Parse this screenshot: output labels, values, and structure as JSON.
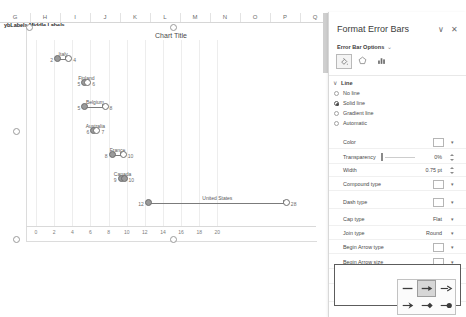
{
  "spreadsheet": {
    "column_headers": [
      "G",
      "H",
      "I",
      "J",
      "K",
      "L",
      "M",
      "N",
      "O",
      "P",
      "Q"
    ],
    "name_box_text": "ybLabels Middle Labels",
    "middle_labels_text": "Middle Labels"
  },
  "chart": {
    "title": "Chart Title",
    "series_label_left": "Left value",
    "series_label_right": "Right value"
  },
  "chart_data": {
    "type": "bar",
    "title": "Chart Title",
    "xlabel": "",
    "ylabel": "",
    "xlim": [
      0,
      30
    ],
    "grid": true,
    "legend": false,
    "orientation": "horizontal",
    "note": "Horizontal dumbbell / range bars with arrow end caps; each category spans from start to end value.",
    "categories": [
      "Italy",
      "Finland",
      "Belgium",
      "Australia",
      "France",
      "Canada",
      "United States"
    ],
    "start_values": [
      2,
      5,
      5,
      6,
      8,
      9,
      12
    ],
    "end_values": [
      4,
      6,
      8,
      7,
      10,
      10,
      28
    ],
    "xticks": [
      0,
      2,
      4,
      6,
      8,
      10,
      12,
      14,
      16,
      18,
      20
    ],
    "xtick_labels": [
      "0",
      "2",
      "4",
      "6",
      "8",
      "10",
      "12",
      "14",
      "16",
      "18",
      "20"
    ]
  },
  "pane": {
    "title": "Format Error Bars",
    "collapse_icon": "∨",
    "close_icon": "✕",
    "options_label": "Error Bar Options",
    "options_chevron": "⌄",
    "tabs": [
      {
        "name": "fill-line-tab",
        "icon": "paint-bucket-icon",
        "selected": true
      },
      {
        "name": "effects-tab",
        "icon": "pentagon-icon",
        "selected": false
      },
      {
        "name": "size-properties-tab",
        "icon": "bar-chart-icon",
        "selected": false
      }
    ],
    "section": {
      "label": "Line",
      "chevron": "∨",
      "radios": [
        {
          "label": "No line",
          "selected": false
        },
        {
          "label": "Solid line",
          "selected": true
        },
        {
          "label": "Gradient line",
          "selected": false
        },
        {
          "label": "Automatic",
          "selected": false
        }
      ],
      "properties": [
        {
          "label": "Color",
          "value": "",
          "control": "color"
        },
        {
          "label": "Transparency",
          "value": "0%",
          "control": "slider-spin"
        },
        {
          "label": "Width",
          "value": "0.75 pt",
          "control": "spin"
        },
        {
          "label": "Compound type",
          "value": "",
          "control": "gallery"
        },
        {
          "label": "Dash type",
          "value": "",
          "control": "gallery"
        },
        {
          "label": "Cap type",
          "value": "Flat",
          "control": "dropdown"
        },
        {
          "label": "Join type",
          "value": "Round",
          "control": "dropdown"
        },
        {
          "label": "Begin Arrow type",
          "value": "",
          "control": "gallery"
        },
        {
          "label": "Begin Arrow size",
          "value": "",
          "control": "gallery"
        },
        {
          "label": "End Arrow type",
          "value": "",
          "control": "gallery"
        },
        {
          "label": "End Arrow size",
          "value": "",
          "control": "gallery"
        }
      ]
    },
    "arrow_popup": {
      "items": [
        {
          "name": "arrow-none",
          "selected": false
        },
        {
          "name": "arrow-triangle",
          "selected": true
        },
        {
          "name": "arrow-open",
          "selected": false
        },
        {
          "name": "arrow-stealth",
          "selected": false
        },
        {
          "name": "arrow-diamond",
          "selected": false
        },
        {
          "name": "arrow-oval",
          "selected": false
        }
      ]
    }
  }
}
